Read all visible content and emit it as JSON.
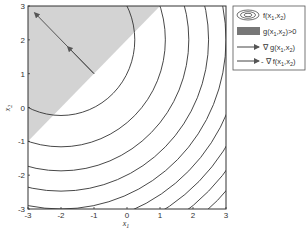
{
  "chart_data": {
    "type": "contour",
    "title": "",
    "xlabel": "x1",
    "ylabel": "x2",
    "xlim": [
      -3,
      3
    ],
    "ylim": [
      -3,
      3
    ],
    "x_ticks": [
      "-3",
      "-2",
      "-1",
      "0",
      "1",
      "2",
      "3"
    ],
    "y_ticks": [
      "-3",
      "-2",
      "-1",
      "0",
      "1",
      "2",
      "3"
    ],
    "grid": false,
    "legend_position": "outside-right-top",
    "contours": {
      "function": "f(x1,x2)",
      "center": [
        -2,
        2
      ],
      "levels": [
        5,
        10,
        15,
        20,
        25,
        30,
        35,
        40,
        45
      ],
      "color": "#333333"
    },
    "feasible_region": {
      "label": "g(x1,x2)>0",
      "boundary_line": "x2 = x1 + 2",
      "side": "above",
      "color": "#d3d3d3"
    },
    "arrows": [
      {
        "label": "∇ g(x1,x2)",
        "from": [
          -1,
          1
        ],
        "to": [
          -1.8,
          1.8
        ]
      },
      {
        "label": "- ∇ f(x1,x2)",
        "from": [
          -1,
          1
        ],
        "to": [
          -2.8,
          2.8
        ]
      }
    ],
    "legend": [
      {
        "symbol": "contour",
        "label": "f(x1,x2)"
      },
      {
        "symbol": "filled-patch",
        "label": "g(x1,x2)>0"
      },
      {
        "symbol": "arrow",
        "label": "∇ g(x1,x2)"
      },
      {
        "symbol": "arrow",
        "label": "- ∇ f(x1,x2)"
      }
    ]
  },
  "axes": {
    "x_label_main": "x",
    "x_label_sub": "1",
    "y_label_main": "x",
    "y_label_sub": "2"
  },
  "legend": {
    "items": [
      {
        "main": "f(x",
        "sub1": "1",
        "mid": ",x",
        "sub2": "2",
        "end": ")"
      },
      {
        "main": "g(x",
        "sub1": "1",
        "mid": ",x",
        "sub2": "2",
        "end": ")>0"
      },
      {
        "main": "∇ g(x",
        "sub1": "1",
        "mid": ",x",
        "sub2": "2",
        "end": ")"
      },
      {
        "main": "- ∇ f(x",
        "sub1": "1",
        "mid": ",x",
        "sub2": "2",
        "end": ")"
      }
    ]
  }
}
